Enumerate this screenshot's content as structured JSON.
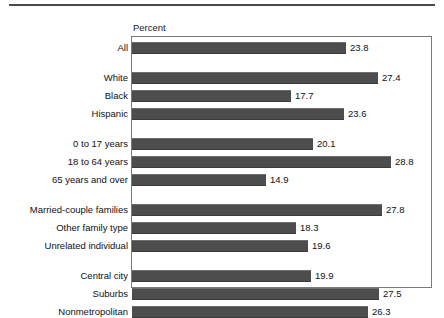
{
  "chart_data": {
    "type": "bar",
    "orientation": "horizontal",
    "title": "",
    "xlabel": "Percent",
    "ylabel": "",
    "xlim": [
      0,
      33
    ],
    "grid": false,
    "legend": null,
    "bar_color": "#4d4d4d",
    "value_label_format": "one-decimal",
    "groups": [
      {
        "name": "",
        "categories": [
          "All"
        ],
        "values": [
          23.8
        ]
      },
      {
        "name": "",
        "categories": [
          "White",
          "Black",
          "Hispanic"
        ],
        "values": [
          27.4,
          17.7,
          23.6
        ]
      },
      {
        "name": "",
        "categories": [
          "0 to 17 years",
          "18 to 64 years",
          "65 years and over"
        ],
        "values": [
          20.1,
          28.8,
          14.9
        ]
      },
      {
        "name": "",
        "categories": [
          "Married-couple families",
          "Other family type",
          "Unrelated individual"
        ],
        "values": [
          27.8,
          18.3,
          19.6
        ]
      },
      {
        "name": "",
        "categories": [
          "Central city",
          "Suburbs",
          "Nonmetropolitan"
        ],
        "values": [
          19.9,
          27.5,
          26.3
        ]
      }
    ],
    "categories": [
      "All",
      "White",
      "Black",
      "Hispanic",
      "0 to 17 years",
      "18 to 64 years",
      "65 years and over",
      "Married-couple families",
      "Other family type",
      "Unrelated individual",
      "Central city",
      "Suburbs",
      "Nonmetropolitan"
    ],
    "values": [
      23.8,
      27.4,
      17.7,
      23.6,
      20.1,
      28.8,
      14.9,
      27.8,
      18.3,
      19.6,
      19.9,
      27.5,
      26.3
    ]
  },
  "axis": {
    "title": "Percent"
  }
}
